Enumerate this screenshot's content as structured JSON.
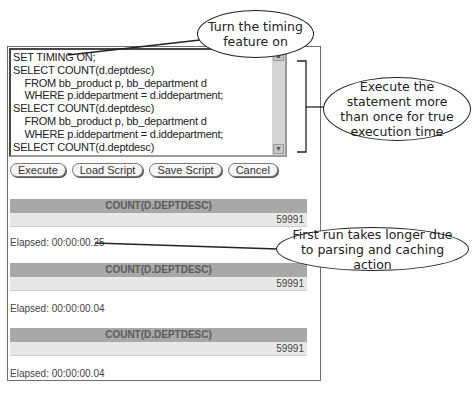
{
  "editor": {
    "lines": [
      "SET TIMING ON;",
      "SELECT COUNT(d.deptdesc)",
      "    FROM bb_product p, bb_department d",
      "    WHERE p.iddepartment = d.iddepartment;",
      "SELECT COUNT(d.deptdesc)",
      "    FROM bb_product p, bb_department d",
      "    WHERE p.iddepartment = d.iddepartment;",
      "SELECT COUNT(d.deptdesc)",
      "    FROM bb_product p, bb_department d",
      "    WHERE p.iddepartment = d.iddepartment;"
    ],
    "scroll_up_icon": "▲",
    "scroll_down_icon": "▼"
  },
  "buttons": {
    "execute": "Execute",
    "load_script": "Load Script",
    "save_script": "Save Script",
    "cancel": "Cancel"
  },
  "results": [
    {
      "header": "COUNT(D.DEPTDESC)",
      "value": "59991",
      "elapsed": "Elapsed: 00:00:00.25"
    },
    {
      "header": "COUNT(D.DEPTDESC)",
      "value": "59991",
      "elapsed": "Elapsed: 00:00:00.04"
    },
    {
      "header": "COUNT(D.DEPTDESC)",
      "value": "59991",
      "elapsed": "Elapsed: 00:00:00.04"
    }
  ],
  "callouts": {
    "timing": "Turn the timing feature on",
    "repeat": "Execute the statement more than once for true execution time",
    "first_run": "First run takes longer due to parsing and caching action"
  }
}
